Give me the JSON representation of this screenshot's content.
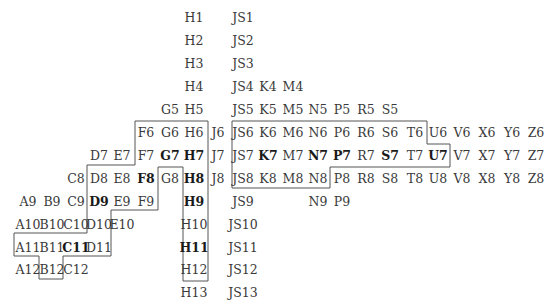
{
  "diagram": {
    "columns": {
      "A": 28,
      "B": 52,
      "C": 76,
      "D": 99,
      "E": 122,
      "F": 146,
      "G": 170,
      "H": 194,
      "J": 218,
      "JS": 243,
      "K": 268,
      "M": 293,
      "N": 318,
      "P": 342,
      "R": 366,
      "S": 390,
      "T": 415,
      "U": 438,
      "V": 462,
      "X": 487,
      "Y": 512,
      "Z": 536
    },
    "rows": {
      "1": 18,
      "2": 41,
      "3": 64,
      "4": 87,
      "5": 110,
      "6": 133,
      "7": 156,
      "8": 179,
      "9": 202,
      "10": 225,
      "11": 248,
      "12": 270,
      "13": 293
    },
    "cells": [
      {
        "label": "H1",
        "col": "H",
        "row": "1",
        "bold": false
      },
      {
        "label": "JS1",
        "col": "JS",
        "row": "1",
        "bold": false
      },
      {
        "label": "H2",
        "col": "H",
        "row": "2",
        "bold": false
      },
      {
        "label": "JS2",
        "col": "JS",
        "row": "2",
        "bold": false
      },
      {
        "label": "H3",
        "col": "H",
        "row": "3",
        "bold": false
      },
      {
        "label": "JS3",
        "col": "JS",
        "row": "3",
        "bold": false
      },
      {
        "label": "H4",
        "col": "H",
        "row": "4",
        "bold": false
      },
      {
        "label": "JS4",
        "col": "JS",
        "row": "4",
        "bold": false
      },
      {
        "label": "K4",
        "col": "K",
        "row": "4",
        "bold": false
      },
      {
        "label": "M4",
        "col": "M",
        "row": "4",
        "bold": false
      },
      {
        "label": "G5",
        "col": "G",
        "row": "5",
        "bold": false
      },
      {
        "label": "H5",
        "col": "H",
        "row": "5",
        "bold": false
      },
      {
        "label": "JS5",
        "col": "JS",
        "row": "5",
        "bold": false
      },
      {
        "label": "K5",
        "col": "K",
        "row": "5",
        "bold": false
      },
      {
        "label": "M5",
        "col": "M",
        "row": "5",
        "bold": false
      },
      {
        "label": "N5",
        "col": "N",
        "row": "5",
        "bold": false
      },
      {
        "label": "P5",
        "col": "P",
        "row": "5",
        "bold": false
      },
      {
        "label": "R5",
        "col": "R",
        "row": "5",
        "bold": false
      },
      {
        "label": "S5",
        "col": "S",
        "row": "5",
        "bold": false
      },
      {
        "label": "F6",
        "col": "F",
        "row": "6",
        "bold": false
      },
      {
        "label": "G6",
        "col": "G",
        "row": "6",
        "bold": false
      },
      {
        "label": "H6",
        "col": "H",
        "row": "6",
        "bold": false
      },
      {
        "label": "J6",
        "col": "J",
        "row": "6",
        "bold": false
      },
      {
        "label": "JS6",
        "col": "JS",
        "row": "6",
        "bold": false
      },
      {
        "label": "K6",
        "col": "K",
        "row": "6",
        "bold": false
      },
      {
        "label": "M6",
        "col": "M",
        "row": "6",
        "bold": false
      },
      {
        "label": "N6",
        "col": "N",
        "row": "6",
        "bold": false
      },
      {
        "label": "P6",
        "col": "P",
        "row": "6",
        "bold": false
      },
      {
        "label": "R6",
        "col": "R",
        "row": "6",
        "bold": false
      },
      {
        "label": "S6",
        "col": "S",
        "row": "6",
        "bold": false
      },
      {
        "label": "T6",
        "col": "T",
        "row": "6",
        "bold": false
      },
      {
        "label": "U6",
        "col": "U",
        "row": "6",
        "bold": false
      },
      {
        "label": "V6",
        "col": "V",
        "row": "6",
        "bold": false
      },
      {
        "label": "X6",
        "col": "X",
        "row": "6",
        "bold": false
      },
      {
        "label": "Y6",
        "col": "Y",
        "row": "6",
        "bold": false
      },
      {
        "label": "Z6",
        "col": "Z",
        "row": "6",
        "bold": false
      },
      {
        "label": "D7",
        "col": "D",
        "row": "7",
        "bold": false
      },
      {
        "label": "E7",
        "col": "E",
        "row": "7",
        "bold": false
      },
      {
        "label": "F7",
        "col": "F",
        "row": "7",
        "bold": false
      },
      {
        "label": "G7",
        "col": "G",
        "row": "7",
        "bold": true
      },
      {
        "label": "H7",
        "col": "H",
        "row": "7",
        "bold": true
      },
      {
        "label": "J7",
        "col": "J",
        "row": "7",
        "bold": false
      },
      {
        "label": "JS7",
        "col": "JS",
        "row": "7",
        "bold": false
      },
      {
        "label": "K7",
        "col": "K",
        "row": "7",
        "bold": true
      },
      {
        "label": "M7",
        "col": "M",
        "row": "7",
        "bold": false
      },
      {
        "label": "N7",
        "col": "N",
        "row": "7",
        "bold": true
      },
      {
        "label": "P7",
        "col": "P",
        "row": "7",
        "bold": true
      },
      {
        "label": "R7",
        "col": "R",
        "row": "7",
        "bold": false
      },
      {
        "label": "S7",
        "col": "S",
        "row": "7",
        "bold": true
      },
      {
        "label": "T7",
        "col": "T",
        "row": "7",
        "bold": false
      },
      {
        "label": "U7",
        "col": "U",
        "row": "7",
        "bold": true
      },
      {
        "label": "V7",
        "col": "V",
        "row": "7",
        "bold": false
      },
      {
        "label": "X7",
        "col": "X",
        "row": "7",
        "bold": false
      },
      {
        "label": "Y7",
        "col": "Y",
        "row": "7",
        "bold": false
      },
      {
        "label": "Z7",
        "col": "Z",
        "row": "7",
        "bold": false
      },
      {
        "label": "C8",
        "col": "C",
        "row": "8",
        "bold": false
      },
      {
        "label": "D8",
        "col": "D",
        "row": "8",
        "bold": false
      },
      {
        "label": "E8",
        "col": "E",
        "row": "8",
        "bold": false
      },
      {
        "label": "F8",
        "col": "F",
        "row": "8",
        "bold": true
      },
      {
        "label": "G8",
        "col": "G",
        "row": "8",
        "bold": false
      },
      {
        "label": "H8",
        "col": "H",
        "row": "8",
        "bold": true
      },
      {
        "label": "J8",
        "col": "J",
        "row": "8",
        "bold": false
      },
      {
        "label": "JS8",
        "col": "JS",
        "row": "8",
        "bold": false
      },
      {
        "label": "K8",
        "col": "K",
        "row": "8",
        "bold": false
      },
      {
        "label": "M8",
        "col": "M",
        "row": "8",
        "bold": false
      },
      {
        "label": "N8",
        "col": "N",
        "row": "8",
        "bold": false
      },
      {
        "label": "P8",
        "col": "P",
        "row": "8",
        "bold": false
      },
      {
        "label": "R8",
        "col": "R",
        "row": "8",
        "bold": false
      },
      {
        "label": "S8",
        "col": "S",
        "row": "8",
        "bold": false
      },
      {
        "label": "T8",
        "col": "T",
        "row": "8",
        "bold": false
      },
      {
        "label": "U8",
        "col": "U",
        "row": "8",
        "bold": false
      },
      {
        "label": "V8",
        "col": "V",
        "row": "8",
        "bold": false
      },
      {
        "label": "X8",
        "col": "X",
        "row": "8",
        "bold": false
      },
      {
        "label": "Y8",
        "col": "Y",
        "row": "8",
        "bold": false
      },
      {
        "label": "Z8",
        "col": "Z",
        "row": "8",
        "bold": false
      },
      {
        "label": "A9",
        "col": "A",
        "row": "9",
        "bold": false
      },
      {
        "label": "B9",
        "col": "B",
        "row": "9",
        "bold": false
      },
      {
        "label": "C9",
        "col": "C",
        "row": "9",
        "bold": false
      },
      {
        "label": "D9",
        "col": "D",
        "row": "9",
        "bold": true
      },
      {
        "label": "E9",
        "col": "E",
        "row": "9",
        "bold": false
      },
      {
        "label": "F9",
        "col": "F",
        "row": "9",
        "bold": false
      },
      {
        "label": "H9",
        "col": "H",
        "row": "9",
        "bold": true
      },
      {
        "label": "JS9",
        "col": "JS",
        "row": "9",
        "bold": false
      },
      {
        "label": "N9",
        "col": "N",
        "row": "9",
        "bold": false
      },
      {
        "label": "P9",
        "col": "P",
        "row": "9",
        "bold": false
      },
      {
        "label": "A10",
        "col": "A",
        "row": "10",
        "bold": false
      },
      {
        "label": "B10",
        "col": "B",
        "row": "10",
        "bold": false
      },
      {
        "label": "C10",
        "col": "C",
        "row": "10",
        "bold": false
      },
      {
        "label": "D10",
        "col": "D",
        "row": "10",
        "bold": false
      },
      {
        "label": "E10",
        "col": "E",
        "row": "10",
        "bold": false
      },
      {
        "label": "H10",
        "col": "H",
        "row": "10",
        "bold": false
      },
      {
        "label": "JS10",
        "col": "JS",
        "row": "10",
        "bold": false
      },
      {
        "label": "A11",
        "col": "A",
        "row": "11",
        "bold": false
      },
      {
        "label": "B11",
        "col": "B",
        "row": "11",
        "bold": false
      },
      {
        "label": "C11",
        "col": "C",
        "row": "11",
        "bold": true
      },
      {
        "label": "D11",
        "col": "D",
        "row": "11",
        "bold": false
      },
      {
        "label": "H11",
        "col": "H",
        "row": "11",
        "bold": true
      },
      {
        "label": "JS11",
        "col": "JS",
        "row": "11",
        "bold": false
      },
      {
        "label": "A12",
        "col": "A",
        "row": "12",
        "bold": false
      },
      {
        "label": "B12",
        "col": "B",
        "row": "12",
        "bold": false
      },
      {
        "label": "C12",
        "col": "C",
        "row": "12",
        "bold": false
      },
      {
        "label": "H12",
        "col": "H",
        "row": "12",
        "bold": false
      },
      {
        "label": "JS12",
        "col": "JS",
        "row": "12",
        "bold": false
      },
      {
        "label": "H13",
        "col": "H",
        "row": "13",
        "bold": false
      },
      {
        "label": "JS13",
        "col": "JS",
        "row": "13",
        "bold": false
      }
    ],
    "outlines": [
      {
        "name": "left-region-outline",
        "points": "135,121 208,121 208,281 183,281 183,167 158,167 158,210 111,210 111,256 63,256 63,279 39,279 39,256 14,256 14,233 87,233 87,165 135,165"
      },
      {
        "name": "right-region-outline",
        "points": "232,121 427,121 427,144 450,144 450,167 330,167 330,188 232,188"
      }
    ],
    "outline_color": "#555555"
  }
}
